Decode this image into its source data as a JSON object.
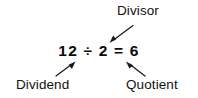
{
  "diagram": {
    "title_present": false,
    "background_color": "#ffffff",
    "text_color": "#000000",
    "equation": {
      "text": "12 ÷ 2 = 6",
      "dividend": "12",
      "operator": "÷",
      "divisor": "2",
      "equals": "=",
      "quotient": "6"
    },
    "labels": {
      "divisor": "Divisor",
      "dividend": "Dividend",
      "quotient": "Quotient"
    },
    "arrows": [
      {
        "name": "divisor-arrow",
        "from_label": "Divisor",
        "points_to": "2",
        "direction": "down-left"
      },
      {
        "name": "dividend-arrow",
        "from_label": "Dividend",
        "points_to": "12",
        "direction": "up-right"
      },
      {
        "name": "quotient-arrow",
        "from_label": "Quotient",
        "points_to": "6",
        "direction": "up-left"
      }
    ]
  }
}
